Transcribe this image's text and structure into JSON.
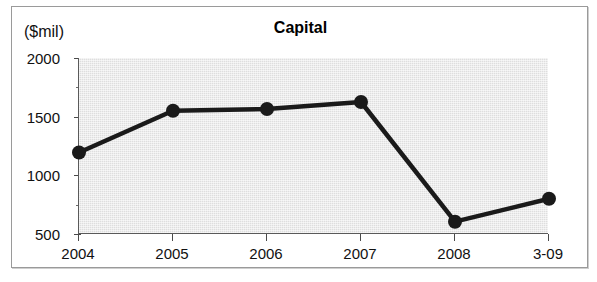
{
  "chart_data": {
    "type": "line",
    "title": "Capital",
    "unit_label": "($mil)",
    "xlabel": "",
    "ylabel": "",
    "categories": [
      "2004",
      "2005",
      "2006",
      "2007",
      "2008",
      "3-09"
    ],
    "values": [
      1195,
      1550,
      1565,
      1625,
      605,
      800
    ],
    "series": [
      {
        "name": "Capital",
        "values": [
          1195,
          1550,
          1565,
          1625,
          605,
          800
        ],
        "color": "#1a1a1a",
        "marker": "circle"
      }
    ],
    "ylim": [
      500,
      2000
    ],
    "ytick_labels": [
      "500",
      "1000",
      "1500",
      "2000"
    ],
    "ytick_values": [
      500,
      1000,
      1500,
      2000
    ],
    "yminor_values": [
      750,
      1250,
      1750
    ],
    "grid": false,
    "legend": "none",
    "plot_background": "#dedede",
    "frame_border": "#9a9a9a"
  }
}
